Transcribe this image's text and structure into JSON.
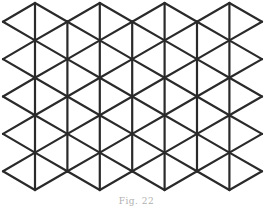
{
  "figure": {
    "caption": "Fig. 22",
    "stroke_color": "#2a2a2a",
    "stroke_width": 2.2,
    "lattice": {
      "x0": 35,
      "dx": 32.4,
      "columns": 7,
      "y_top": 3,
      "dy": 37.4,
      "rows": 5,
      "left_x": 3,
      "right_x": 262
    }
  }
}
